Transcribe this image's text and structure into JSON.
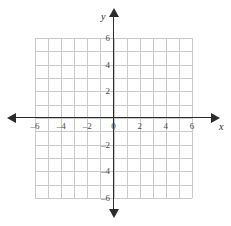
{
  "chart_data": {
    "type": "scatter",
    "title": "",
    "xlabel": "x",
    "ylabel": "y",
    "xlim": [
      -6,
      6
    ],
    "ylim": [
      -6,
      6
    ],
    "grid": true,
    "grid_step": 1,
    "legend": "none",
    "series": [],
    "x_ticks": [
      {
        "value": -6,
        "label": "–6"
      },
      {
        "value": -4,
        "label": "–4"
      },
      {
        "value": -2,
        "label": "–2"
      },
      {
        "value": 0,
        "label": "0"
      },
      {
        "value": 2,
        "label": "2"
      },
      {
        "value": 4,
        "label": "4"
      },
      {
        "value": 6,
        "label": "6"
      }
    ],
    "y_ticks": [
      {
        "value": 6,
        "label": "6"
      },
      {
        "value": 4,
        "label": "4"
      },
      {
        "value": 2,
        "label": "2"
      },
      {
        "value": -2,
        "label": "–2"
      },
      {
        "value": -4,
        "label": "–4"
      },
      {
        "value": -6,
        "label": "–6"
      }
    ],
    "colors": {
      "grid": "#c9c9c9",
      "axis": "#2b2b2b",
      "label": "#4a4a4a",
      "background": "#ffffff"
    }
  },
  "axes": {
    "x_name": "x",
    "y_name": "y",
    "origin_label": "0"
  },
  "icons": {
    "arrow_left": "arrow-left-icon",
    "arrow_right": "arrow-right-icon",
    "arrow_up": "arrow-up-icon",
    "arrow_down": "arrow-down-icon"
  }
}
